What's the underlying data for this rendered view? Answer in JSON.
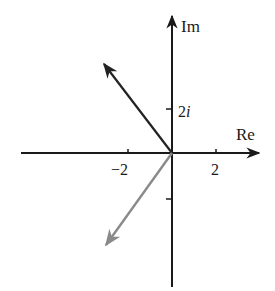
{
  "diagram": {
    "type": "complex-plane-vectors",
    "axes": {
      "x_label": "Re",
      "y_label": "Im",
      "x_ticks": [
        {
          "value": -2,
          "label": "−2"
        },
        {
          "value": 2,
          "label": "2"
        }
      ],
      "y_ticks": [
        {
          "value": 2,
          "label_num": "2",
          "label_unit": "i"
        },
        {
          "value": -2,
          "label_num": "",
          "label_unit": ""
        }
      ]
    },
    "vectors": [
      {
        "name": "upper-left-vector",
        "from": [
          0,
          0
        ],
        "to": [
          -3,
          4
        ],
        "color": "#222222"
      },
      {
        "name": "lower-left-vector",
        "from": [
          0,
          0
        ],
        "to": [
          -3,
          -4
        ],
        "color": "#8a8a8a"
      }
    ],
    "colors": {
      "axis": "#1a1a1a",
      "vector_dark": "#222222",
      "vector_gray": "#8a8a8a",
      "background": "#ffffff"
    }
  }
}
